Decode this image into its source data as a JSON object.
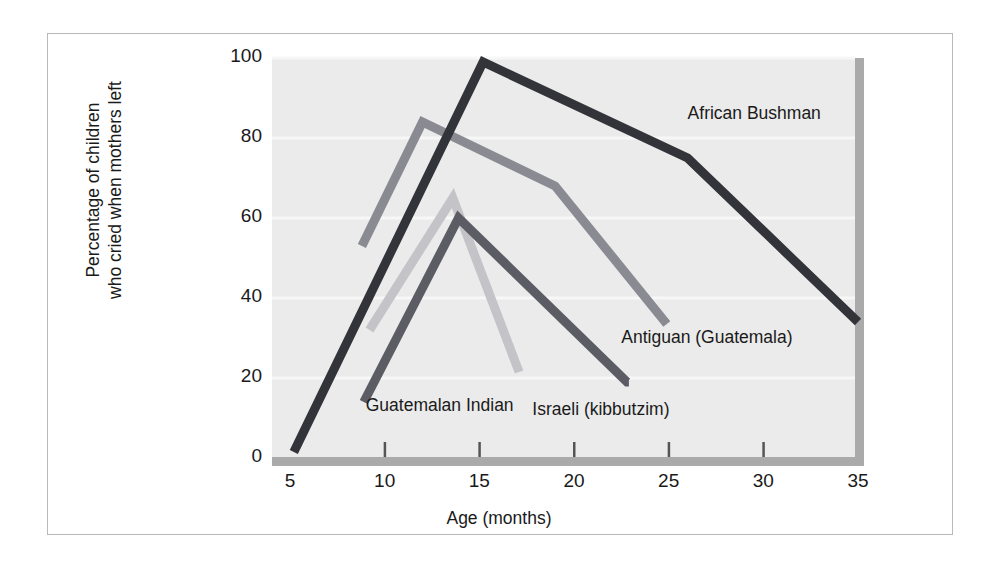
{
  "chart_data": {
    "type": "line",
    "title": "",
    "xlabel": "Age (months)",
    "ylabel_line1": "Percentage of children",
    "ylabel_line2": "who cried when mothers left",
    "ylabel": "Percentage of children who cried when mothers left",
    "xlim": [
      3.5,
      35
    ],
    "ylim": [
      0,
      100
    ],
    "xticks": [
      5,
      10,
      15,
      20,
      25,
      30,
      35
    ],
    "yticks": [
      0,
      20,
      40,
      60,
      80,
      100
    ],
    "grid": "horizontal-light",
    "legend_position": "inline-annotations",
    "plot_background": "#ebebeb",
    "series": [
      {
        "name": "African Bushman",
        "color": "#33333a",
        "label_x": 26.0,
        "label_y": 86,
        "x": [
          5.2,
          15.2,
          26.0,
          35.0
        ],
        "y": [
          1.5,
          99.0,
          75.0,
          34.0
        ]
      },
      {
        "name": "Antiguan (Guatemala)",
        "color": "#8a8a92",
        "label_x": 22.5,
        "label_y": 30,
        "x": [
          8.8,
          12.0,
          19.0,
          24.9
        ],
        "y": [
          53.0,
          84.0,
          68.0,
          33.5
        ]
      },
      {
        "name": "Israeli (kibbutzim)",
        "color": "#5c5c64",
        "label_x": 17.8,
        "label_y": 12,
        "x": [
          8.9,
          13.9,
          22.8,
          22.9
        ],
        "y": [
          14.0,
          60.0,
          19.0,
          19.0
        ]
      },
      {
        "name": "Guatemalan Indian",
        "color": "#c3c3c8",
        "label_x": 9.0,
        "label_y": 13,
        "x": [
          9.2,
          13.6,
          17.1
        ],
        "y": [
          32.0,
          65.0,
          21.5
        ]
      }
    ]
  },
  "axis": {
    "y_ticks_text": [
      "100",
      "80",
      "60",
      "40",
      "20",
      "0"
    ],
    "x_ticks_text": [
      "5",
      "10",
      "15",
      "20",
      "25",
      "30",
      "35"
    ]
  },
  "colors": {
    "frame": "#b9b9b9",
    "axis_bar": "#aaaaaa",
    "plot_bg": "#ebebeb",
    "text": "#1a1a1a"
  }
}
